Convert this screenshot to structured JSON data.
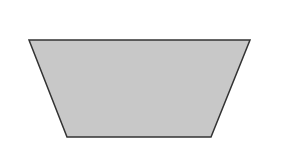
{
  "diagram": {
    "type": "trapezoid",
    "fill_color": "#c8c8c8",
    "stroke_color": "#333333",
    "labels": {
      "top": "2a",
      "bottom": "a",
      "left": "12",
      "right": "12"
    }
  }
}
